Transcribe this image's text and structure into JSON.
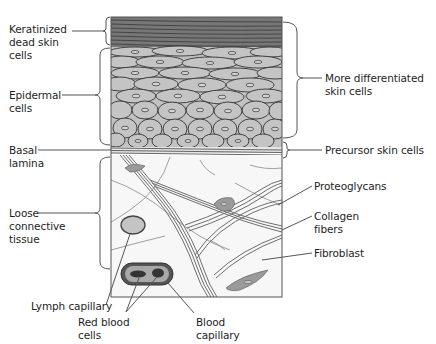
{
  "diagram": {
    "type": "labeled cross-section",
    "labels_left": [
      {
        "id": "keratinized",
        "text": "Keratinized\ndead skin\ncells"
      },
      {
        "id": "epidermal",
        "text": "Epidermal\ncells"
      },
      {
        "id": "basal",
        "text": "Basal\nlamina"
      },
      {
        "id": "loose",
        "text": "Loose\nconnective\ntissue"
      }
    ],
    "labels_right": [
      {
        "id": "differentiated",
        "text": "More differentiated\nskin cells"
      },
      {
        "id": "precursor",
        "text": "Precursor skin cells"
      },
      {
        "id": "proteoglycans",
        "text": "Proteoglycans"
      },
      {
        "id": "collagen",
        "text": "Collagen\nfibers"
      },
      {
        "id": "fibroblast",
        "text": "Fibroblast"
      }
    ],
    "labels_bottom": [
      {
        "id": "lymph",
        "text": "Lymph capillary"
      },
      {
        "id": "rbc",
        "text": "Red blood\ncells"
      },
      {
        "id": "blood",
        "text": "Blood\ncapillary"
      }
    ],
    "colors": {
      "outline": "#3a3a3a",
      "keratin": "#6e6e6e",
      "cell_fill": "#bdbdbd",
      "fiber": "#7a7a7a",
      "fibroblast": "#9a9a9a",
      "capillary_wall": "#4a4a4a",
      "background": "#ffffff"
    }
  }
}
